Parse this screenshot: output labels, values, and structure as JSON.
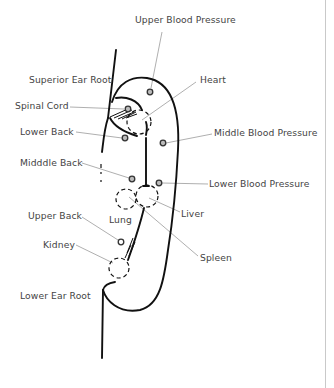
{
  "diagram": {
    "labels": {
      "upper_blood_pressure": "Upper Blood Pressure",
      "superior_ear_root": "Superior Ear Root",
      "heart": "Heart",
      "spinal_cord": "Spinal Cord",
      "lower_back": "Lower Back",
      "middle_blood_pressure": "Middle Blood Pressure",
      "middle_back": "Midddle Back",
      "lower_blood_pressure": "Lower Blood Pressure",
      "liver": "Liver",
      "upper_back": "Upper Back",
      "lung": "Lung",
      "kidney": "Kidney",
      "spleen": "Spleen",
      "lower_ear_root": "Lower Ear Root"
    },
    "colors": {
      "outline": "#111111",
      "leader_line": "#9a9a9a",
      "label_text": "#444444",
      "border": "#c9c9c9"
    }
  }
}
